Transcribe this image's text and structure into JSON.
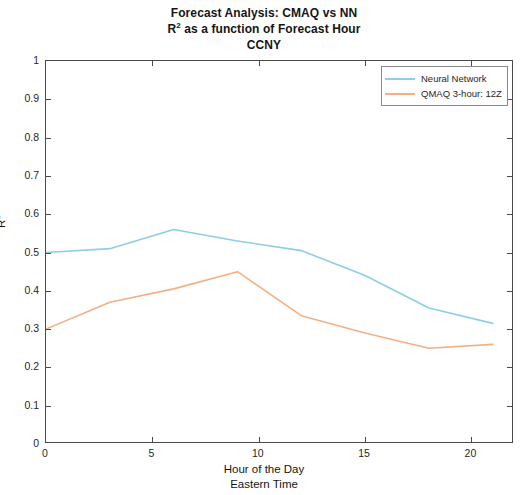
{
  "chart_data": {
    "type": "line",
    "title": "Forecast Analysis: CMAQ vs NN",
    "title_lines": [
      "Forecast Analysis: CMAQ vs NN",
      "R² as a function of Forecast Hour",
      "CCNY"
    ],
    "title_line1": "Forecast Analysis: CMAQ vs NN",
    "title_line2_pre": "R",
    "title_line2_sup": "2",
    "title_line2_post": " as a function of Forecast Hour",
    "title_line3": "CCNY",
    "xlabel": "Hour of the Day",
    "xlabel_line2": "Eastern Time",
    "ylabel_pre": "R",
    "ylabel_sup": "2",
    "ylim": [
      0,
      1
    ],
    "xlim": [
      0,
      22
    ],
    "xticks": [
      0,
      5,
      10,
      15,
      20
    ],
    "xtick_labels": [
      "0",
      "5",
      "10",
      "15",
      "20"
    ],
    "yticks": [
      0,
      0.1,
      0.2,
      0.3,
      0.4,
      0.5,
      0.6,
      0.7,
      0.8,
      0.9,
      1
    ],
    "ytick_labels": [
      "0",
      "0.1",
      "0.2",
      "0.3",
      "0.4",
      "0.5",
      "0.6",
      "0.7",
      "0.8",
      "0.9",
      "1"
    ],
    "grid": false,
    "legend_position": "top-right",
    "x": [
      0,
      3,
      6,
      9,
      12,
      15,
      18,
      21
    ],
    "series": [
      {
        "name": "Neural Network",
        "color": "#8ECDE6",
        "values": [
          0.5,
          0.51,
          0.56,
          0.53,
          0.505,
          0.44,
          0.355,
          0.315
        ]
      },
      {
        "name": "QMAQ 3-hour: 12Z",
        "color": "#F3B183",
        "values": [
          0.3,
          0.37,
          0.405,
          0.45,
          0.335,
          0.29,
          0.25,
          0.26
        ]
      }
    ]
  },
  "legend": {
    "items": [
      {
        "label": "Neural Network",
        "color": "#8ECDE6"
      },
      {
        "label": "QMAQ 3-hour: 12Z",
        "color": "#F3B183"
      }
    ]
  },
  "axes": {
    "y_axis_label_pre": "R",
    "y_axis_label_sup": "2",
    "x_axis_label_primary": "Hour of the Day",
    "x_axis_label_secondary": "Eastern Time"
  }
}
